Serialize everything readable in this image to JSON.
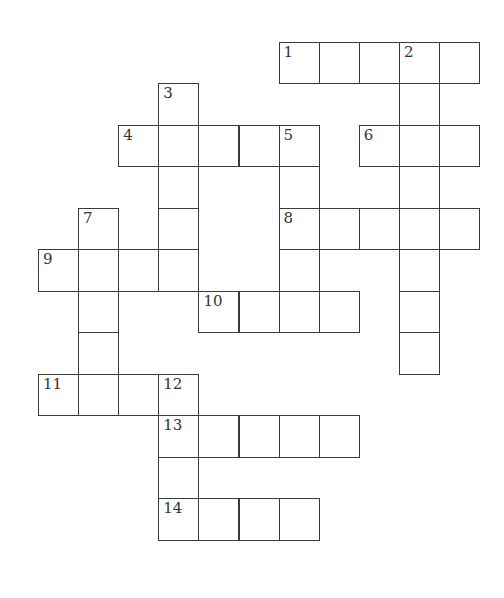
{
  "puzzle": {
    "type": "crossword",
    "origin": {
      "x": 38,
      "y": 41.5
    },
    "cell_w": 40.1,
    "cell_h": 41.5,
    "colors": {
      "border": "#3a3a3a",
      "fill": "#ffffff",
      "number": "#333333"
    },
    "cells": [
      {
        "r": 0,
        "c": 6,
        "n": "1"
      },
      {
        "r": 0,
        "c": 7
      },
      {
        "r": 0,
        "c": 8
      },
      {
        "r": 0,
        "c": 9,
        "n": "2"
      },
      {
        "r": 0,
        "c": 10
      },
      {
        "r": 1,
        "c": 3,
        "n": "3"
      },
      {
        "r": 1,
        "c": 9
      },
      {
        "r": 2,
        "c": 2,
        "n": "4"
      },
      {
        "r": 2,
        "c": 3
      },
      {
        "r": 2,
        "c": 4
      },
      {
        "r": 2,
        "c": 5
      },
      {
        "r": 2,
        "c": 6,
        "n": "5"
      },
      {
        "r": 2,
        "c": 8,
        "n": "6"
      },
      {
        "r": 2,
        "c": 9
      },
      {
        "r": 2,
        "c": 10
      },
      {
        "r": 3,
        "c": 3
      },
      {
        "r": 3,
        "c": 6
      },
      {
        "r": 3,
        "c": 9
      },
      {
        "r": 4,
        "c": 1,
        "n": "7"
      },
      {
        "r": 4,
        "c": 3
      },
      {
        "r": 4,
        "c": 6,
        "n": "8"
      },
      {
        "r": 4,
        "c": 7
      },
      {
        "r": 4,
        "c": 8
      },
      {
        "r": 4,
        "c": 9
      },
      {
        "r": 4,
        "c": 10
      },
      {
        "r": 5,
        "c": 0,
        "n": "9"
      },
      {
        "r": 5,
        "c": 1
      },
      {
        "r": 5,
        "c": 2
      },
      {
        "r": 5,
        "c": 3
      },
      {
        "r": 5,
        "c": 6
      },
      {
        "r": 5,
        "c": 9
      },
      {
        "r": 6,
        "c": 1
      },
      {
        "r": 6,
        "c": 4,
        "n": "10"
      },
      {
        "r": 6,
        "c": 5
      },
      {
        "r": 6,
        "c": 6
      },
      {
        "r": 6,
        "c": 7
      },
      {
        "r": 6,
        "c": 9
      },
      {
        "r": 7,
        "c": 1
      },
      {
        "r": 7,
        "c": 9
      },
      {
        "r": 8,
        "c": 0,
        "n": "11"
      },
      {
        "r": 8,
        "c": 1
      },
      {
        "r": 8,
        "c": 2
      },
      {
        "r": 8,
        "c": 3,
        "n": "12"
      },
      {
        "r": 9,
        "c": 3,
        "n": "13"
      },
      {
        "r": 9,
        "c": 4
      },
      {
        "r": 9,
        "c": 5
      },
      {
        "r": 9,
        "c": 6
      },
      {
        "r": 9,
        "c": 7
      },
      {
        "r": 10,
        "c": 3
      },
      {
        "r": 11,
        "c": 3,
        "n": "14"
      },
      {
        "r": 11,
        "c": 4
      },
      {
        "r": 11,
        "c": 5
      },
      {
        "r": 11,
        "c": 6
      }
    ],
    "clue_numbers": {
      "across": [
        "1",
        "4",
        "6",
        "8",
        "9",
        "10",
        "11",
        "13",
        "14"
      ],
      "down": [
        "2",
        "3",
        "5",
        "7",
        "12"
      ]
    }
  }
}
